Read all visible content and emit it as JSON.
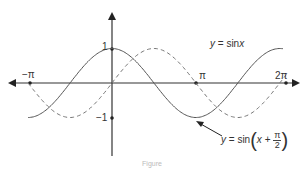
{
  "chart_data": {
    "type": "line",
    "title": "",
    "xlabel": "",
    "ylabel": "",
    "x_ticks": [
      "-π",
      "π",
      "2π"
    ],
    "y_ticks": [
      "1",
      "-1"
    ],
    "xlim": [
      -3.14159,
      6.28318
    ],
    "ylim": [
      -1,
      1
    ],
    "grid": false,
    "series": [
      {
        "name": "y = sin(x + π/2)",
        "style": "solid",
        "color": "#555555",
        "x": [
          -3.14,
          -1.57,
          0,
          1.57,
          3.14,
          4.71,
          6.28
        ],
        "values": [
          -1,
          0,
          1,
          0,
          -1,
          0,
          1
        ]
      },
      {
        "name": "y = sinx",
        "style": "dashed",
        "color": "#777777",
        "x": [
          -3.14,
          -1.57,
          0,
          1.57,
          3.14,
          4.71,
          6.28
        ],
        "values": [
          0,
          -1,
          0,
          1,
          0,
          -1,
          0
        ]
      }
    ],
    "annotations": [
      {
        "text": "y = sinx",
        "position": "upper right"
      },
      {
        "text": "y = sin(x + π/2)",
        "position": "lower right",
        "arrow_to": "trough of solid curve near x = π"
      }
    ]
  },
  "labels": {
    "neg_pi": "−π",
    "pi": "π",
    "two_pi": "2π",
    "one": "1",
    "neg_one": "−1",
    "sinx_y": "y",
    "sinx_eq": " = sin",
    "sinx_x": "x",
    "shift_y": "y",
    "shift_eq": " = sin",
    "shift_x": "x",
    "shift_plus": " + ",
    "frac_num": "π",
    "frac_den": "2",
    "paren_open": "(",
    "paren_close": ")",
    "caption": "Figure"
  },
  "colors": {
    "axis": "#333333",
    "solid": "#555555",
    "dashed": "#777777"
  }
}
